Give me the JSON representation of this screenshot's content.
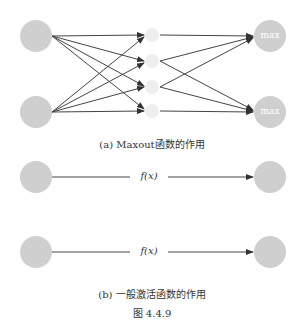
{
  "figure": {
    "panel_a": {
      "caption": "(a) Maxout函数的作用",
      "input_nodes": 2,
      "hidden_nodes": 4,
      "output_nodes": [
        {
          "label": "max"
        },
        {
          "label": "max"
        }
      ]
    },
    "panel_b": {
      "caption": "(b) 一般激活函数的作用",
      "rows": [
        {
          "label": "f(x)"
        },
        {
          "label": "f(x)"
        }
      ]
    },
    "figure_label": "图 4.4.9"
  },
  "colors": {
    "node_fill": "#cfcfcf",
    "hidden_fill": "#eeeeee",
    "edge": "#333333"
  }
}
